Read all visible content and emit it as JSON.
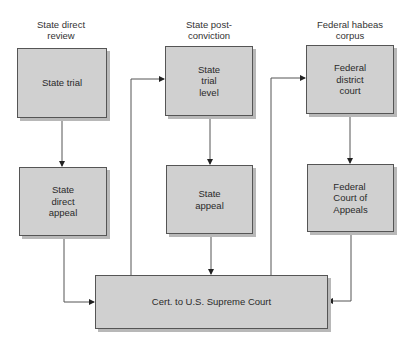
{
  "diagram": {
    "columns": [
      {
        "heading": "State direct\nreview",
        "boxes": [
          "State trial",
          "State\ndirect\nappeal"
        ]
      },
      {
        "heading": "State post-\nconviction",
        "boxes": [
          "State\ntrial\nlevel",
          "State\nappeal"
        ]
      },
      {
        "heading": "Federal habeas\ncorpus",
        "boxes": [
          "Federal\ndistrict\ncourt",
          "Federal\nCourt of\nAppeals"
        ]
      }
    ],
    "bottom_box": "Cert. to U.S. Supreme Court",
    "colors": {
      "box_fill": "#d0d0d0",
      "box_border": "#555555",
      "shadow": "#b8b8b8",
      "line": "#444444"
    }
  }
}
